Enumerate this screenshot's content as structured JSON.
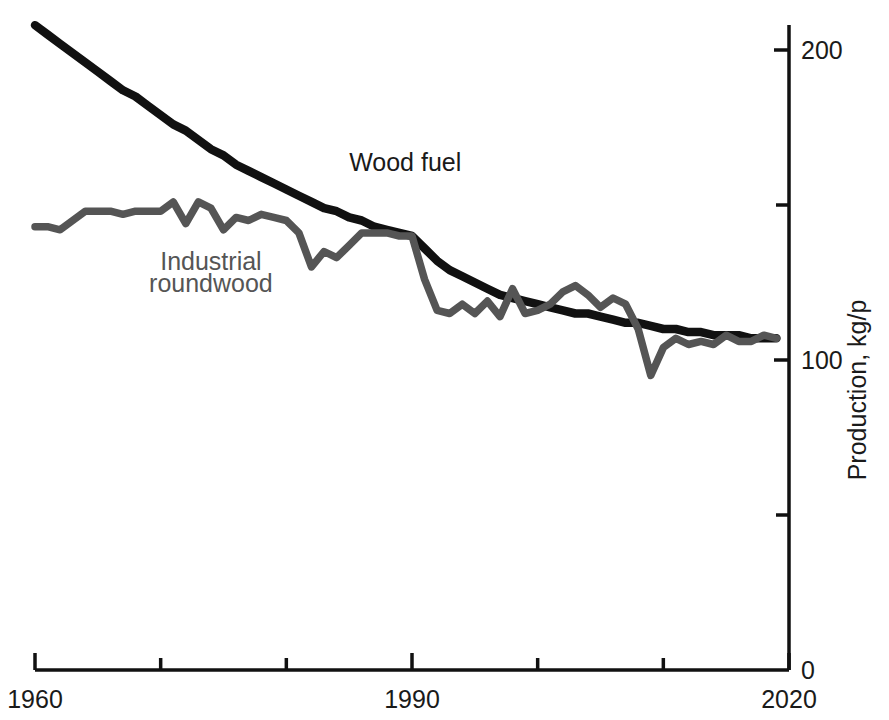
{
  "chart_data": {
    "type": "line",
    "title": "",
    "subtitle": "",
    "xlabel": "",
    "ylabel": "Production, kg/p",
    "xlim": [
      1960,
      2020
    ],
    "ylim": [
      0,
      220
    ],
    "x_ticks_major": [
      1960,
      1990,
      2020
    ],
    "x_ticks_major_labels": [
      "1960",
      "1990",
      "2020"
    ],
    "x_ticks_minor": [
      1970,
      1980,
      2000,
      2010
    ],
    "y_ticks_major": [
      0,
      100,
      200
    ],
    "y_ticks_major_labels": [
      "0",
      "100",
      "200"
    ],
    "y_ticks_minor": [
      50,
      150
    ],
    "grid": false,
    "legend_position": "inline-annotations",
    "axis_position": {
      "y_axis": "right",
      "x_axis": "bottom"
    },
    "colors": {
      "wood_fuel": "#111111",
      "industrial_roundwood": "#555555",
      "axis": "#111111",
      "text": "#1a1a1a",
      "background": "#ffffff"
    },
    "annotations": [
      {
        "text": "Wood fuel",
        "x": 1985,
        "y": 161,
        "color": "#1a1a1a"
      },
      {
        "text": "Industrial",
        "x": 1974,
        "y": 129,
        "color": "#555555"
      },
      {
        "text": "roundwood",
        "x": 1974,
        "y": 122,
        "color": "#555555"
      }
    ],
    "series": [
      {
        "name": "Wood fuel",
        "color": "#111111",
        "x": [
          1960,
          1961,
          1962,
          1963,
          1964,
          1965,
          1966,
          1967,
          1968,
          1969,
          1970,
          1971,
          1972,
          1973,
          1974,
          1975,
          1976,
          1977,
          1978,
          1979,
          1980,
          1981,
          1982,
          1983,
          1984,
          1985,
          1986,
          1987,
          1988,
          1989,
          1990,
          1991,
          1992,
          1993,
          1994,
          1995,
          1996,
          1997,
          1998,
          1999,
          2000,
          2001,
          2002,
          2003,
          2004,
          2005,
          2006,
          2007,
          2008,
          2009,
          2010,
          2011,
          2012,
          2013,
          2014,
          2015,
          2016,
          2017,
          2018,
          2019
        ],
        "values": [
          208,
          205,
          202,
          199,
          196,
          193,
          190,
          187,
          185,
          182,
          179,
          176,
          174,
          171,
          168,
          166,
          163,
          161,
          159,
          157,
          155,
          153,
          151,
          149,
          148,
          146,
          145,
          143,
          142,
          141,
          140,
          136,
          132,
          129,
          127,
          125,
          123,
          121,
          120,
          119,
          118,
          117,
          116,
          115,
          115,
          114,
          113,
          112,
          112,
          111,
          110,
          110,
          109,
          109,
          108,
          108,
          108,
          107,
          107,
          107
        ]
      },
      {
        "name": "Industrial roundwood",
        "color": "#555555",
        "x": [
          1960,
          1961,
          1962,
          1963,
          1964,
          1965,
          1966,
          1967,
          1968,
          1969,
          1970,
          1971,
          1972,
          1973,
          1974,
          1975,
          1976,
          1977,
          1978,
          1979,
          1980,
          1981,
          1982,
          1983,
          1984,
          1985,
          1986,
          1987,
          1988,
          1989,
          1990,
          1991,
          1992,
          1993,
          1994,
          1995,
          1996,
          1997,
          1998,
          1999,
          2000,
          2001,
          2002,
          2003,
          2004,
          2005,
          2006,
          2007,
          2008,
          2009,
          2010,
          2011,
          2012,
          2013,
          2014,
          2015,
          2016,
          2017,
          2018,
          2019
        ],
        "values": [
          143,
          143,
          142,
          145,
          148,
          148,
          148,
          147,
          148,
          148,
          148,
          151,
          144,
          151,
          149,
          142,
          146,
          145,
          147,
          146,
          145,
          141,
          130,
          135,
          133,
          137,
          141,
          141,
          141,
          140,
          140,
          126,
          116,
          115,
          118,
          115,
          119,
          114,
          123,
          115,
          116,
          118,
          122,
          124,
          121,
          117,
          120,
          118,
          110,
          95,
          104,
          107,
          105,
          106,
          105,
          108,
          106,
          106,
          108,
          107
        ]
      }
    ]
  },
  "axis": {
    "y_title": "Production, kg/p"
  }
}
